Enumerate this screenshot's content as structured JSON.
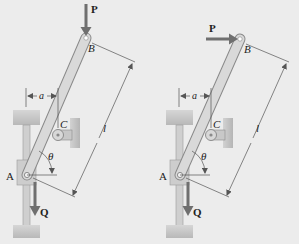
{
  "figure": {
    "colors": {
      "background": "#ececec",
      "rod_fill": "#d4d4d4",
      "rod_stroke": "#8a8a8a",
      "support_fill": "#c4c4c4",
      "arrow": "#6f6f6f",
      "dimension_line": "#555555"
    },
    "panels": [
      {
        "id": "left",
        "load_P_direction": "vertical-down",
        "labels": {
          "P": "P",
          "B": "B",
          "C": "C",
          "A": "A",
          "Q": "Q",
          "a": "a",
          "theta": "θ",
          "l": "l"
        }
      },
      {
        "id": "right",
        "load_P_direction": "horizontal-right",
        "labels": {
          "P": "P",
          "B": "B",
          "C": "C",
          "A": "A",
          "Q": "Q",
          "a": "a",
          "theta": "θ",
          "l": "l"
        }
      }
    ]
  }
}
